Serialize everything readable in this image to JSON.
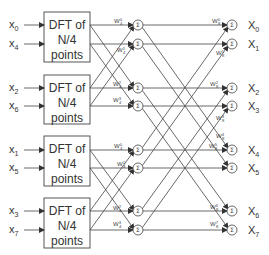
{
  "diagram": {
    "type": "FFT radix-2 decimation-in-time signal flow graph (N=8, two final stages)",
    "dft_blocks": [
      {
        "line1": "DFT of",
        "line2": "N/4",
        "line3": "points",
        "inputs": [
          {
            "base": "x",
            "sub": "0"
          },
          {
            "base": "x",
            "sub": "4"
          }
        ]
      },
      {
        "line1": "DFT of",
        "line2": "N/4",
        "line3": "points",
        "inputs": [
          {
            "base": "x",
            "sub": "2"
          },
          {
            "base": "x",
            "sub": "6"
          }
        ]
      },
      {
        "line1": "DFT of",
        "line2": "N/4",
        "line3": "points",
        "inputs": [
          {
            "base": "x",
            "sub": "1"
          },
          {
            "base": "x",
            "sub": "5"
          }
        ]
      },
      {
        "line1": "DFT of",
        "line2": "N/4",
        "line3": "points",
        "inputs": [
          {
            "base": "x",
            "sub": "3"
          },
          {
            "base": "x",
            "sub": "7"
          }
        ]
      }
    ],
    "sum_symbol": "Σ",
    "stage1_twiddles": [
      {
        "base": "W",
        "sup": "0",
        "sub": "4"
      },
      {
        "base": "W",
        "sup": "1",
        "sub": "4"
      },
      {
        "base": "W",
        "sup": "2",
        "sub": "4"
      },
      {
        "base": "W",
        "sup": "3",
        "sub": "4"
      },
      {
        "base": "W",
        "sup": "0",
        "sub": "4"
      },
      {
        "base": "W",
        "sup": "1",
        "sub": "4"
      },
      {
        "base": "W",
        "sup": "2",
        "sub": "4"
      },
      {
        "base": "W",
        "sup": "3",
        "sub": "4"
      }
    ],
    "stage2_twiddles": [
      {
        "base": "W",
        "sup": "0",
        "sub": "8"
      },
      {
        "base": "W",
        "sup": "1",
        "sub": "8"
      },
      {
        "base": "W",
        "sup": "2",
        "sub": "8"
      },
      {
        "base": "W",
        "sup": "3",
        "sub": "8"
      },
      {
        "base": "W",
        "sup": "4",
        "sub": "8"
      },
      {
        "base": "W",
        "sup": "5",
        "sub": "8"
      },
      {
        "base": "W",
        "sup": "6",
        "sub": "8"
      },
      {
        "base": "W",
        "sup": "7",
        "sub": "8"
      }
    ],
    "outputs": [
      {
        "base": "X",
        "sub": "0"
      },
      {
        "base": "X",
        "sub": "1"
      },
      {
        "base": "X",
        "sub": "2"
      },
      {
        "base": "X",
        "sub": "3"
      },
      {
        "base": "X",
        "sub": "4"
      },
      {
        "base": "X",
        "sub": "5"
      },
      {
        "base": "X",
        "sub": "6"
      },
      {
        "base": "X",
        "sub": "7"
      }
    ]
  }
}
